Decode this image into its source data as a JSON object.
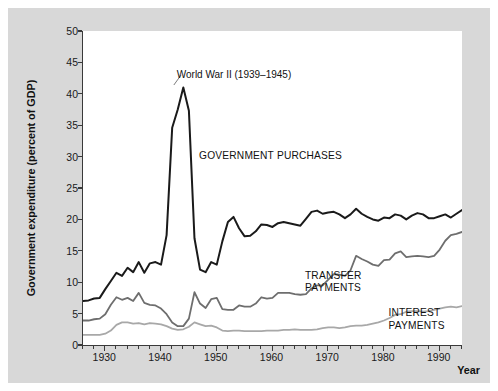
{
  "chart_data": {
    "type": "line",
    "title": "",
    "xlabel": "Year",
    "ylabel": "Government expenditure (percent of GDP)",
    "xlim": [
      1926,
      1994
    ],
    "ylim": [
      0,
      50
    ],
    "xticks": [
      1930,
      1940,
      1950,
      1960,
      1970,
      1980,
      1990
    ],
    "yticks": [
      0,
      5,
      10,
      15,
      20,
      25,
      30,
      35,
      40,
      45,
      50
    ],
    "grid": false,
    "legend_position": "inline-annotations",
    "annotations": [
      {
        "text": "World War II (1939–1945)",
        "x": 1943,
        "y": 44
      },
      {
        "text": "GOVERNMENT PURCHASES",
        "x": 1947,
        "y": 31
      },
      {
        "text": "TRANSFER\nPAYMENTS",
        "x": 1966,
        "y": 12
      },
      {
        "text": "INTEREST\nPAYMENTS",
        "x": 1981,
        "y": 6
      }
    ],
    "x": [
      1926,
      1927,
      1928,
      1929,
      1930,
      1931,
      1932,
      1933,
      1934,
      1935,
      1936,
      1937,
      1938,
      1939,
      1940,
      1941,
      1942,
      1943,
      1944,
      1945,
      1946,
      1947,
      1948,
      1949,
      1950,
      1951,
      1952,
      1953,
      1954,
      1955,
      1956,
      1957,
      1958,
      1959,
      1960,
      1961,
      1962,
      1963,
      1964,
      1965,
      1966,
      1967,
      1968,
      1969,
      1970,
      1971,
      1972,
      1973,
      1974,
      1975,
      1976,
      1977,
      1978,
      1979,
      1980,
      1981,
      1982,
      1983,
      1984,
      1985,
      1986,
      1987,
      1988,
      1989,
      1990,
      1991,
      1992,
      1993,
      1994
    ],
    "series": [
      {
        "name": "GOVERNMENT PURCHASES",
        "color": "#1a1a1a",
        "width": 2.0,
        "values": [
          7.0,
          7.1,
          7.4,
          7.5,
          8.9,
          10.2,
          11.5,
          11.0,
          12.3,
          11.6,
          13.2,
          11.5,
          13.0,
          13.2,
          12.8,
          17.5,
          34.6,
          37.5,
          41.0,
          37.3,
          17.0,
          12.0,
          11.6,
          13.2,
          12.8,
          16.5,
          19.6,
          20.4,
          18.6,
          17.3,
          17.4,
          18.1,
          19.2,
          19.1,
          18.8,
          19.4,
          19.6,
          19.4,
          19.2,
          19.0,
          20.1,
          21.2,
          21.4,
          20.9,
          21.1,
          21.2,
          20.8,
          20.2,
          20.8,
          21.7,
          20.9,
          20.4,
          20.0,
          19.8,
          20.3,
          20.2,
          20.8,
          20.6,
          20.0,
          20.6,
          21.0,
          20.8,
          20.2,
          20.2,
          20.5,
          20.8,
          20.3,
          20.9,
          21.5
        ]
      },
      {
        "name": "TRANSFER PAYMENTS",
        "color": "#6e6e6e",
        "width": 1.8,
        "values": [
          3.9,
          3.9,
          4.1,
          4.2,
          4.9,
          6.4,
          7.6,
          7.2,
          7.5,
          7.0,
          8.3,
          6.7,
          6.4,
          6.3,
          5.8,
          4.9,
          3.6,
          3.0,
          3.0,
          4.2,
          8.4,
          6.6,
          5.9,
          7.3,
          7.5,
          5.7,
          5.6,
          5.6,
          6.3,
          6.1,
          6.1,
          6.6,
          7.6,
          7.4,
          7.5,
          8.3,
          8.3,
          8.3,
          8.1,
          8.0,
          8.1,
          9.0,
          9.5,
          9.5,
          10.4,
          11.3,
          11.2,
          11.0,
          11.9,
          14.2,
          13.7,
          13.3,
          12.8,
          12.6,
          13.5,
          13.6,
          14.6,
          14.9,
          14.0,
          14.1,
          14.2,
          14.1,
          14.0,
          14.2,
          15.2,
          16.6,
          17.5,
          17.7,
          18.0
        ]
      },
      {
        "name": "INTEREST PAYMENTS",
        "color": "#a8a8a8",
        "width": 1.8,
        "values": [
          1.6,
          1.6,
          1.6,
          1.6,
          1.8,
          2.3,
          3.2,
          3.6,
          3.6,
          3.4,
          3.5,
          3.3,
          3.5,
          3.4,
          3.3,
          3.0,
          2.6,
          2.4,
          2.5,
          2.9,
          3.6,
          3.3,
          3.0,
          3.1,
          2.8,
          2.3,
          2.2,
          2.3,
          2.3,
          2.2,
          2.2,
          2.2,
          2.2,
          2.3,
          2.3,
          2.3,
          2.4,
          2.4,
          2.5,
          2.4,
          2.4,
          2.4,
          2.5,
          2.7,
          2.8,
          2.8,
          2.7,
          2.8,
          3.0,
          3.1,
          3.1,
          3.2,
          3.4,
          3.6,
          3.9,
          4.3,
          4.8,
          4.9,
          5.3,
          5.4,
          5.4,
          5.3,
          5.4,
          5.6,
          5.8,
          6.0,
          6.1,
          6.0,
          6.2
        ]
      }
    ]
  },
  "figure": {
    "axis_color": "#3a3a3a",
    "background": "#d8d8d8",
    "plot_background": "#ffffff"
  }
}
